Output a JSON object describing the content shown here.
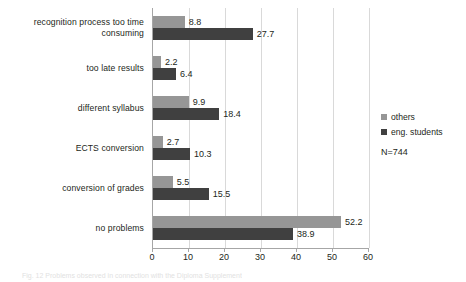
{
  "chart_data": {
    "type": "bar",
    "orientation": "horizontal",
    "title": "",
    "xlabel": "",
    "ylabel": "",
    "xlim": [
      0,
      60
    ],
    "xticks": [
      0,
      10,
      20,
      30,
      40,
      50,
      60
    ],
    "grid": true,
    "legend_position": "right",
    "categories": [
      "recognition process too time consuming",
      "too late results",
      "different syllabus",
      "ECTS conversion",
      "conversion of grades",
      "no problems"
    ],
    "category_lines": [
      [
        "recognition process too time",
        "consuming"
      ],
      [
        "too late results"
      ],
      [
        "different syllabus"
      ],
      [
        "ECTS conversion"
      ],
      [
        "conversion of grades"
      ],
      [
        "no problems"
      ]
    ],
    "series": [
      {
        "name": "others",
        "color": "#969696",
        "values": [
          8.8,
          2.2,
          9.9,
          2.7,
          5.5,
          52.2
        ]
      },
      {
        "name": "eng. students",
        "color": "#404040",
        "values": [
          27.7,
          6.4,
          18.4,
          10.3,
          15.5,
          38.9
        ]
      }
    ],
    "annotations": {
      "sample_size": "N=744"
    }
  },
  "legend": {
    "items": [
      {
        "label": "others"
      },
      {
        "label": "eng. students"
      }
    ],
    "note": "N=744"
  },
  "xaxis": {
    "labels": [
      "0",
      "10",
      "20",
      "30",
      "40",
      "50",
      "60"
    ]
  },
  "caption": {
    "text": "Fig. 12  Problems observed in connection with the Diploma Supplement"
  }
}
